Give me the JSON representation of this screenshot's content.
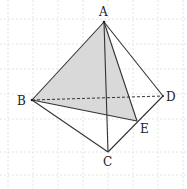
{
  "diagram": {
    "type": "tetrahedron",
    "vertices": {
      "A": {
        "label": "A",
        "x": 104,
        "y": 22
      },
      "B": {
        "label": "B",
        "x": 32,
        "y": 100
      },
      "C": {
        "label": "C",
        "x": 108,
        "y": 152
      },
      "D": {
        "label": "D",
        "x": 163,
        "y": 96
      },
      "E": {
        "label": "E",
        "x": 137,
        "y": 121
      }
    },
    "labels": {
      "A": "A",
      "B": "B",
      "C": "C",
      "D": "D",
      "E": "E"
    },
    "shaded_face": "ABE",
    "hidden_edge": "BD",
    "colors": {
      "line": "#333333",
      "shade": "#d9d9d9",
      "grid": "#e4e4e4",
      "background": "#ffffff"
    }
  }
}
